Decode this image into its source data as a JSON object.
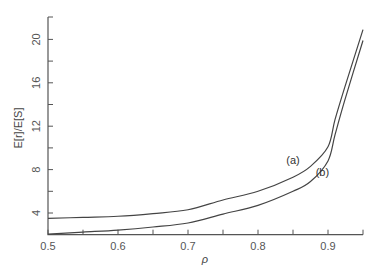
{
  "chart_data": {
    "type": "line",
    "title": "",
    "xlabel": "ρ",
    "ylabel": "E[r]/E[S]",
    "xlim": [
      0.5,
      0.95
    ],
    "ylim": [
      2.0,
      22.0
    ],
    "grid": false,
    "legend": "none (inline curve labels)",
    "x_ticks": [
      0.5,
      0.55,
      0.6,
      0.65,
      0.7,
      0.75,
      0.8,
      0.85,
      0.9,
      0.95
    ],
    "x_tick_labels": [
      "0.5",
      "",
      "0.6",
      "",
      "0.7",
      "",
      "0.8",
      "",
      "0.9",
      ""
    ],
    "y_ticks": [
      4,
      6,
      8,
      10,
      12,
      14,
      16,
      18,
      20
    ],
    "y_tick_labels": [
      "4",
      "",
      "8",
      "",
      "12",
      "",
      "16",
      "",
      "20"
    ],
    "series": [
      {
        "name": "(a)",
        "x": [
          0.5,
          0.55,
          0.6,
          0.65,
          0.7,
          0.75,
          0.8,
          0.85,
          0.875,
          0.9,
          0.91,
          0.924,
          0.95
        ],
        "values": [
          3.5,
          3.6,
          3.7,
          3.95,
          4.3,
          5.2,
          6.0,
          7.3,
          8.3,
          10.1,
          12.6,
          15.6,
          20.9
        ],
        "label_pos": {
          "x": 0.85,
          "y": 8.5
        }
      },
      {
        "name": "(b)",
        "x": [
          0.5,
          0.55,
          0.6,
          0.65,
          0.7,
          0.75,
          0.8,
          0.85,
          0.875,
          0.9,
          0.91,
          0.924,
          0.95
        ],
        "values": [
          2.05,
          2.24,
          2.43,
          2.71,
          3.08,
          3.9,
          4.7,
          6.0,
          6.9,
          8.8,
          11.2,
          14.4,
          19.9
        ],
        "label_pos": {
          "x": 0.892,
          "y": 7.4
        }
      }
    ]
  }
}
